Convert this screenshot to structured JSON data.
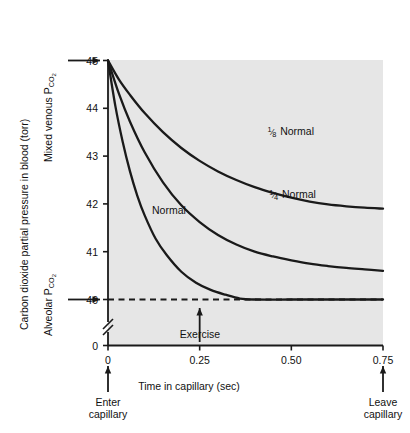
{
  "figure": {
    "plot_bg_color": "#e6e6e6",
    "line_color": "#1a1a1a",
    "axis_color": "#1a1a1a"
  },
  "axes": {
    "y_axis_title": "Carbon dioxide partial pressure in blood (torr)",
    "y_ticks": [
      "45",
      "44",
      "43",
      "42",
      "41",
      "40",
      "0"
    ],
    "y_tick_values": [
      45,
      44,
      43,
      42,
      41,
      40,
      0
    ],
    "y_break": true,
    "x_axis_title": "Time in capillary (sec)",
    "x_ticks": [
      "0",
      "0.25",
      "0.50",
      "0.75"
    ],
    "x_tick_values": [
      0,
      0.25,
      0.5,
      0.75
    ]
  },
  "annotations": {
    "mixed_venous": {
      "line1": "Mixed venous P",
      "sub": "CO",
      "sub2": "2",
      "value": 45
    },
    "alveolar": {
      "line1": "Alveolar P",
      "sub": "CO",
      "sub2": "2",
      "value": 40
    },
    "exercise": {
      "label": "Exercise",
      "at_x": 0.25
    },
    "enter_capillary": {
      "line1": "Enter",
      "line2": "capillary",
      "at_x": 0
    },
    "leave_capillary": {
      "line1": "Leave",
      "line2": "capillary",
      "at_x": 0.75
    },
    "dashed_reference_value": 40
  },
  "chart_data": {
    "type": "line",
    "title": "",
    "xlabel": "Time in capillary (sec)",
    "ylabel": "Carbon dioxide partial pressure in blood (torr)",
    "xlim": [
      0,
      0.75
    ],
    "ylim": [
      40,
      45
    ],
    "grid": false,
    "legend": "inline-curve-labels",
    "x_tick_labels": [
      "0",
      "0.25",
      "0.50",
      "0.75"
    ],
    "y_tick_labels": [
      "45",
      "44",
      "43",
      "42",
      "41",
      "40",
      "0"
    ],
    "reference_lines": [
      {
        "name": "alveolar-pco2",
        "y": 40,
        "style": "dashed",
        "x_from": 0,
        "x_to": 0.75
      }
    ],
    "series": [
      {
        "name": "Normal",
        "label": "Normal",
        "label_x": 0.12,
        "label_y": 41.85,
        "x": [
          0,
          0.02,
          0.04,
          0.06,
          0.08,
          0.1,
          0.13,
          0.16,
          0.2,
          0.24,
          0.28,
          0.32,
          0.36,
          0.4,
          0.5,
          0.6,
          0.75
        ],
        "y": [
          45.0,
          44.05,
          43.3,
          42.68,
          42.17,
          41.76,
          41.27,
          40.93,
          40.58,
          40.35,
          40.2,
          40.1,
          40.02,
          40.0,
          40.0,
          40.0,
          40.0
        ]
      },
      {
        "name": "Quarter Normal",
        "label_numerator": "1",
        "label_denominator": "4",
        "label_text": "Normal",
        "label_x": 0.44,
        "label_y": 42.18,
        "x": [
          0,
          0.03,
          0.06,
          0.1,
          0.15,
          0.2,
          0.25,
          0.3,
          0.35,
          0.4,
          0.45,
          0.5,
          0.55,
          0.6,
          0.65,
          0.7,
          0.75
        ],
        "y": [
          45.0,
          44.3,
          43.72,
          43.08,
          42.45,
          41.97,
          41.62,
          41.35,
          41.15,
          41.0,
          40.9,
          40.82,
          40.75,
          40.7,
          40.66,
          40.63,
          40.6
        ]
      },
      {
        "name": "Eighth Normal",
        "label_numerator": "1",
        "label_denominator": "8",
        "label_text": "Normal",
        "label_x": 0.435,
        "label_y": 43.5,
        "x": [
          0,
          0.03,
          0.06,
          0.1,
          0.15,
          0.2,
          0.25,
          0.3,
          0.35,
          0.4,
          0.45,
          0.5,
          0.55,
          0.6,
          0.65,
          0.7,
          0.75
        ],
        "y": [
          45.0,
          44.6,
          44.28,
          43.9,
          43.5,
          43.17,
          42.9,
          42.68,
          42.5,
          42.35,
          42.23,
          42.13,
          42.05,
          41.99,
          41.95,
          41.92,
          41.9
        ]
      }
    ]
  }
}
